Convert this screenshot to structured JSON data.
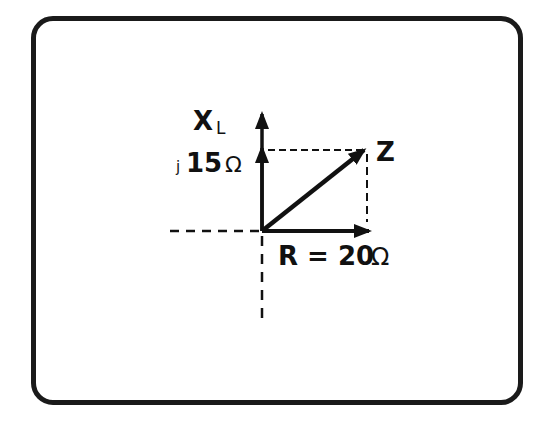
{
  "diagram": {
    "type": "impedance-phasor",
    "colors": {
      "ink": "#111111",
      "background": "#ffffff"
    },
    "labels": {
      "xl_symbol": "X",
      "xl_subscript": "L",
      "xl_value_prefix": "j",
      "xl_value_number": "15",
      "xl_value_unit": "Ω",
      "z_symbol": "Z",
      "r_text": "R = 20",
      "r_unit": "Ω"
    },
    "values": {
      "resistance_ohms": 20,
      "inductive_reactance_ohms": 15
    }
  }
}
